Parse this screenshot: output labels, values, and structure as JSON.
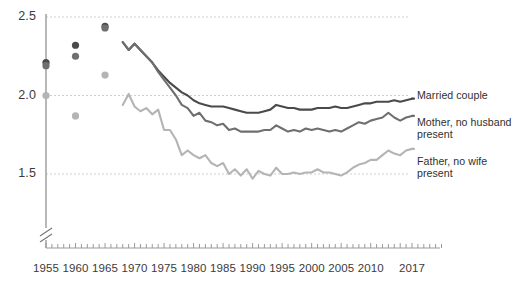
{
  "chart_data": {
    "type": "line",
    "title": "",
    "subtitle": "",
    "xlabel": "",
    "ylabel": "",
    "xlim": [
      1954,
      2018
    ],
    "ylim": [
      1.35,
      2.55
    ],
    "yticks": [
      "2.5",
      "2.0",
      "1.5"
    ],
    "ytick_values": [
      2.5,
      2.0,
      1.5
    ],
    "xticks": [
      "1955",
      "1960",
      "1965",
      "1970",
      "1975",
      "1980",
      "1985",
      "1990",
      "1995",
      "2000",
      "2005",
      "2010",
      "2017"
    ],
    "xtick_values": [
      1955,
      1960,
      1965,
      1970,
      1975,
      1980,
      1985,
      1990,
      1995,
      2000,
      2005,
      2010,
      2017
    ],
    "grid": "horizontal-dotted",
    "axis_break": "y-axis-break-below-plot",
    "legend_position": "right-inline",
    "colors": {
      "married_couple": "#4a4a4a",
      "mother_no_husband": "#6f6f6f",
      "father_no_wife": "#b4b4b4",
      "gridline": "#cfcfcf",
      "axis": "#9a9a9a",
      "text": "#3b3b3b"
    },
    "series": [
      {
        "name": "Married couple",
        "color": "#4a4a4a",
        "markers": [
          {
            "x": 1955,
            "y": 2.21
          },
          {
            "x": 1960,
            "y": 2.32
          },
          {
            "x": 1965,
            "y": 2.44
          }
        ],
        "x": [
          1968,
          1969,
          1970,
          1971,
          1972,
          1973,
          1974,
          1975,
          1976,
          1977,
          1978,
          1979,
          1980,
          1981,
          1982,
          1983,
          1984,
          1985,
          1986,
          1987,
          1988,
          1989,
          1990,
          1991,
          1992,
          1993,
          1994,
          1995,
          1996,
          1997,
          1998,
          1999,
          2000,
          2001,
          2002,
          2003,
          2004,
          2005,
          2006,
          2007,
          2008,
          2009,
          2010,
          2011,
          2012,
          2013,
          2014,
          2015,
          2016,
          2017
        ],
        "values": [
          2.34,
          2.29,
          2.33,
          2.29,
          2.25,
          2.21,
          2.16,
          2.12,
          2.08,
          2.05,
          2.02,
          2.0,
          1.97,
          1.95,
          1.94,
          1.93,
          1.93,
          1.93,
          1.92,
          1.91,
          1.9,
          1.89,
          1.89,
          1.89,
          1.9,
          1.91,
          1.94,
          1.93,
          1.92,
          1.92,
          1.91,
          1.91,
          1.91,
          1.92,
          1.92,
          1.92,
          1.93,
          1.92,
          1.92,
          1.93,
          1.94,
          1.95,
          1.95,
          1.96,
          1.96,
          1.96,
          1.97,
          1.96,
          1.97,
          1.98
        ]
      },
      {
        "name": "Mother, no husband present",
        "color": "#6f6f6f",
        "markers": [
          {
            "x": 1955,
            "y": 2.19
          },
          {
            "x": 1960,
            "y": 2.25
          },
          {
            "x": 1965,
            "y": 2.43
          }
        ],
        "x": [
          1968,
          1969,
          1970,
          1971,
          1972,
          1973,
          1974,
          1975,
          1976,
          1977,
          1978,
          1979,
          1980,
          1981,
          1982,
          1983,
          1984,
          1985,
          1986,
          1987,
          1988,
          1989,
          1990,
          1991,
          1992,
          1993,
          1994,
          1995,
          1996,
          1997,
          1998,
          1999,
          2000,
          2001,
          2002,
          2003,
          2004,
          2005,
          2006,
          2007,
          2008,
          2009,
          2010,
          2011,
          2012,
          2013,
          2014,
          2015,
          2016,
          2017
        ],
        "values": [
          2.34,
          2.29,
          2.33,
          2.29,
          2.25,
          2.21,
          2.15,
          2.1,
          2.05,
          2.0,
          1.94,
          1.92,
          1.87,
          1.89,
          1.84,
          1.83,
          1.81,
          1.82,
          1.78,
          1.79,
          1.77,
          1.77,
          1.77,
          1.77,
          1.78,
          1.78,
          1.81,
          1.79,
          1.77,
          1.78,
          1.77,
          1.79,
          1.78,
          1.79,
          1.78,
          1.77,
          1.78,
          1.77,
          1.79,
          1.81,
          1.83,
          1.82,
          1.84,
          1.85,
          1.86,
          1.89,
          1.86,
          1.84,
          1.86,
          1.87
        ]
      },
      {
        "name": "Father, no wife present",
        "color": "#b4b4b4",
        "markers": [
          {
            "x": 1955,
            "y": 2.0
          },
          {
            "x": 1960,
            "y": 1.87
          },
          {
            "x": 1965,
            "y": 2.13
          }
        ],
        "x": [
          1968,
          1969,
          1970,
          1971,
          1972,
          1973,
          1974,
          1975,
          1976,
          1977,
          1978,
          1979,
          1980,
          1981,
          1982,
          1983,
          1984,
          1985,
          1986,
          1987,
          1988,
          1989,
          1990,
          1991,
          1992,
          1993,
          1994,
          1995,
          1996,
          1997,
          1998,
          1999,
          2000,
          2001,
          2002,
          2003,
          2004,
          2005,
          2006,
          2007,
          2008,
          2009,
          2010,
          2011,
          2012,
          2013,
          2014,
          2015,
          2016,
          2017
        ],
        "values": [
          1.94,
          2.01,
          1.93,
          1.9,
          1.92,
          1.88,
          1.91,
          1.78,
          1.78,
          1.72,
          1.62,
          1.65,
          1.62,
          1.6,
          1.62,
          1.57,
          1.55,
          1.57,
          1.5,
          1.53,
          1.49,
          1.53,
          1.47,
          1.52,
          1.5,
          1.49,
          1.54,
          1.5,
          1.5,
          1.51,
          1.5,
          1.51,
          1.51,
          1.53,
          1.51,
          1.51,
          1.5,
          1.49,
          1.51,
          1.54,
          1.56,
          1.57,
          1.59,
          1.59,
          1.62,
          1.65,
          1.63,
          1.62,
          1.65,
          1.66
        ]
      }
    ],
    "legend": [
      {
        "label_line1": "Married couple",
        "label_line2": ""
      },
      {
        "label_line1": "Mother, no husband",
        "label_line2": "present"
      },
      {
        "label_line1": "Father, no wife",
        "label_line2": "present"
      }
    ]
  }
}
